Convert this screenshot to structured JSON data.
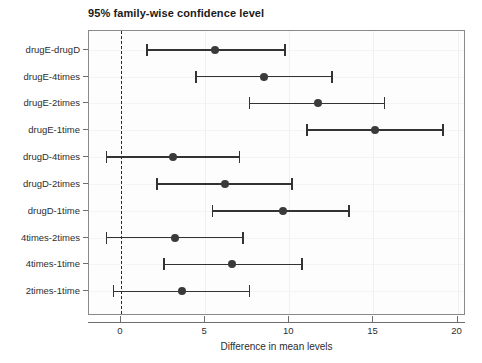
{
  "chart_data": {
    "type": "scatter",
    "plot_style": "confidence-interval-dotplot",
    "title": "95% family-wise confidence level",
    "xlabel": "Difference in mean levels",
    "ylabel": "",
    "xlim": [
      -1.9,
      20.5
    ],
    "ylim": [
      0,
      11
    ],
    "xticks": [
      0,
      5,
      10,
      15,
      20
    ],
    "xtick_labels": [
      "0",
      "5",
      "10",
      "15",
      "20"
    ],
    "grid": true,
    "legend": null,
    "reference_line": {
      "x": 0,
      "style": "dashed",
      "color": "#2b2b2b"
    },
    "point_color": "#3a3a3a",
    "line_color": "#333333",
    "categories": [
      "drugE-drugD",
      "drugE-4times",
      "drugE-2times",
      "drugE-1time",
      "drugD-4times",
      "drugD-2times",
      "drugD-1time",
      "4times-2times",
      "4times-1time",
      "2times-1time"
    ],
    "estimates": [
      5.6,
      8.5,
      11.7,
      15.1,
      3.1,
      6.2,
      9.6,
      3.2,
      6.6,
      3.6
    ],
    "lower": [
      1.5,
      4.4,
      7.6,
      11.0,
      -0.9,
      2.1,
      5.4,
      -0.9,
      2.5,
      -0.5
    ],
    "upper": [
      9.7,
      12.5,
      15.6,
      19.1,
      7.0,
      10.1,
      13.5,
      7.2,
      10.7,
      7.6
    ],
    "intervals": [
      {
        "label": "drugE-drugD",
        "estimate": 5.6,
        "lower": 1.5,
        "upper": 9.7
      },
      {
        "label": "drugE-4times",
        "estimate": 8.5,
        "lower": 4.4,
        "upper": 12.5
      },
      {
        "label": "drugE-2times",
        "estimate": 11.7,
        "lower": 7.6,
        "upper": 15.6
      },
      {
        "label": "drugE-1time",
        "estimate": 15.1,
        "lower": 11.0,
        "upper": 19.1
      },
      {
        "label": "drugD-4times",
        "estimate": 3.1,
        "lower": -0.9,
        "upper": 7.0
      },
      {
        "label": "drugD-2times",
        "estimate": 6.2,
        "lower": 2.1,
        "upper": 10.1
      },
      {
        "label": "drugD-1time",
        "estimate": 9.6,
        "lower": 5.4,
        "upper": 13.5
      },
      {
        "label": "4times-2times",
        "estimate": 3.2,
        "lower": -0.9,
        "upper": 7.2
      },
      {
        "label": "4times-1time",
        "estimate": 6.6,
        "lower": 2.5,
        "upper": 10.7
      },
      {
        "label": "2times-1time",
        "estimate": 3.6,
        "lower": -0.5,
        "upper": 7.6
      }
    ]
  }
}
